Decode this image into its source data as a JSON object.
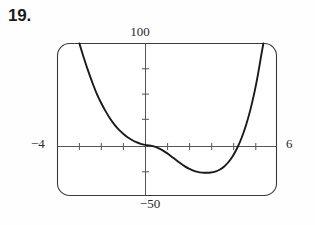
{
  "problem": {
    "number": "19."
  },
  "chart_data": {
    "type": "line",
    "title": "",
    "subtitle": "",
    "xlabel": "",
    "ylabel": "",
    "style": "graphing-calculator-window",
    "grid": false,
    "legend": null,
    "xlim": [
      -4,
      6
    ],
    "ylim": [
      -50,
      100
    ],
    "xtick_step": 1,
    "ytick_step": 25,
    "tick_labels": {
      "ymax": "100",
      "ymin": "−50",
      "xmin": "−4",
      "xmax": "6"
    },
    "axis_color": "#4a4a4a",
    "curve_color": "#1a1a1a",
    "frame_color": "#3a3a3a",
    "background": "#ffffff",
    "features": {
      "local_minimum": {
        "x": 3.3,
        "y": -27
      },
      "inflection_flat_region": {
        "x": 0.0,
        "y": 0
      },
      "x_intercepts": [
        0.0,
        4.6
      ],
      "exits_top_left_at_x": -3.0,
      "exits_top_right_at_x": 5.2
    },
    "series": [
      {
        "name": "f(x)",
        "points": [
          [
            -3.0,
            100
          ],
          [
            -2.8,
            86
          ],
          [
            -2.6,
            73
          ],
          [
            -2.4,
            61
          ],
          [
            -2.2,
            50
          ],
          [
            -2.0,
            41
          ],
          [
            -1.8,
            33
          ],
          [
            -1.6,
            26
          ],
          [
            -1.4,
            20
          ],
          [
            -1.2,
            15
          ],
          [
            -1.0,
            11
          ],
          [
            -0.8,
            7.5
          ],
          [
            -0.6,
            4.8
          ],
          [
            -0.4,
            2.6
          ],
          [
            -0.2,
            1.0
          ],
          [
            0.0,
            0.0
          ],
          [
            0.2,
            -0.6
          ],
          [
            0.4,
            -1.6
          ],
          [
            0.6,
            -3.2
          ],
          [
            0.8,
            -5.4
          ],
          [
            1.0,
            -8.2
          ],
          [
            1.2,
            -11.4
          ],
          [
            1.4,
            -14.8
          ],
          [
            1.6,
            -18.0
          ],
          [
            1.8,
            -21.0
          ],
          [
            2.0,
            -23.5
          ],
          [
            2.2,
            -25.4
          ],
          [
            2.4,
            -26.7
          ],
          [
            2.6,
            -27.4
          ],
          [
            2.8,
            -27.6
          ],
          [
            3.0,
            -27.3
          ],
          [
            3.2,
            -26.4
          ],
          [
            3.4,
            -24.6
          ],
          [
            3.6,
            -21.6
          ],
          [
            3.8,
            -17.2
          ],
          [
            4.0,
            -11.2
          ],
          [
            4.2,
            -3.4
          ],
          [
            4.4,
            6.5
          ],
          [
            4.6,
            18.8
          ],
          [
            4.8,
            34.0
          ],
          [
            5.0,
            52.5
          ],
          [
            5.15,
            69.0
          ],
          [
            5.3,
            88.0
          ],
          [
            5.4,
            100
          ]
        ]
      }
    ]
  }
}
